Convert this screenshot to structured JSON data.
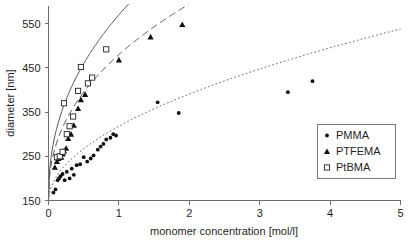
{
  "chart_data": {
    "type": "scatter",
    "title": "",
    "xlabel": "monomer concentration [mol/l]",
    "ylabel": "diameter [nm]",
    "xlim": [
      0,
      5
    ],
    "ylim": [
      150,
      590
    ],
    "xticks": [
      0,
      1,
      2,
      3,
      4,
      5
    ],
    "yticks": [
      150,
      250,
      350,
      450,
      550
    ],
    "xtick_labels": [
      "0",
      "1",
      "2",
      "3",
      "4",
      "5"
    ],
    "ytick_labels": [
      "150",
      "250",
      "350",
      "450",
      "550"
    ],
    "grid": false,
    "legend_position": "bottom-right",
    "series": [
      {
        "name": "PMMA",
        "marker": "small-filled-circle",
        "line_style": "dotted",
        "color": "#111111",
        "points": [
          [
            0.07,
            168
          ],
          [
            0.1,
            175
          ],
          [
            0.13,
            196
          ],
          [
            0.15,
            200
          ],
          [
            0.17,
            205
          ],
          [
            0.2,
            210
          ],
          [
            0.23,
            196
          ],
          [
            0.26,
            215
          ],
          [
            0.3,
            200
          ],
          [
            0.33,
            222
          ],
          [
            0.36,
            208
          ],
          [
            0.4,
            230
          ],
          [
            0.45,
            232
          ],
          [
            0.5,
            248
          ],
          [
            0.55,
            238
          ],
          [
            0.6,
            245
          ],
          [
            0.64,
            252
          ],
          [
            0.7,
            265
          ],
          [
            0.74,
            272
          ],
          [
            0.78,
            278
          ],
          [
            0.82,
            288
          ],
          [
            0.88,
            292
          ],
          [
            0.92,
            300
          ],
          [
            0.96,
            297
          ],
          [
            1.55,
            372
          ],
          [
            1.85,
            348
          ],
          [
            3.4,
            395
          ],
          [
            3.75,
            420
          ]
        ],
        "fit": {
          "type": "power",
          "y0": 150,
          "a": 168,
          "b": 0.52
        }
      },
      {
        "name": "PTFEMA",
        "marker": "filled-triangle",
        "line_style": "dashed",
        "color": "#111111",
        "points": [
          [
            0.09,
            225
          ],
          [
            0.12,
            238
          ],
          [
            0.14,
            245
          ],
          [
            0.16,
            250
          ],
          [
            0.18,
            248
          ],
          [
            0.2,
            255
          ],
          [
            0.22,
            262
          ],
          [
            0.25,
            268
          ],
          [
            0.28,
            290
          ],
          [
            0.32,
            300
          ],
          [
            0.36,
            320
          ],
          [
            0.42,
            358
          ],
          [
            0.46,
            378
          ],
          [
            0.52,
            390
          ],
          [
            1.0,
            468
          ],
          [
            1.45,
            520
          ],
          [
            1.9,
            548
          ]
        ],
        "fit": {
          "type": "power",
          "y0": 150,
          "a": 330,
          "b": 0.43
        }
      },
      {
        "name": "PtBMA",
        "marker": "open-square",
        "line_style": "solid",
        "color": "#222222",
        "points": [
          [
            0.12,
            248
          ],
          [
            0.16,
            250
          ],
          [
            0.2,
            260
          ],
          [
            0.22,
            370
          ],
          [
            0.26,
            300
          ],
          [
            0.3,
            318
          ],
          [
            0.35,
            340
          ],
          [
            0.42,
            398
          ],
          [
            0.46,
            452
          ],
          [
            0.56,
            415
          ],
          [
            0.62,
            428
          ],
          [
            0.82,
            492
          ]
        ],
        "fit": {
          "type": "power",
          "y0": 150,
          "a": 420,
          "b": 0.44
        }
      }
    ]
  },
  "legend": {
    "entries": [
      {
        "label": "PMMA",
        "marker": "small-filled-circle"
      },
      {
        "label": "PTFEMA",
        "marker": "filled-triangle"
      },
      {
        "label": "PtBMA",
        "marker": "open-square"
      }
    ]
  }
}
